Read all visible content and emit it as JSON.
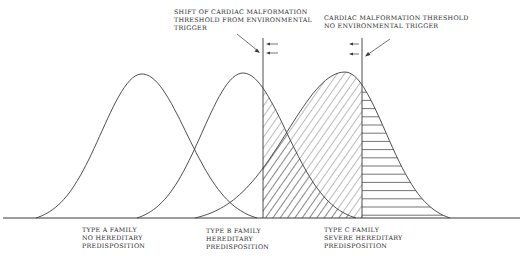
{
  "diagram": {
    "annotations": {
      "shift_threshold": [
        "SHIFT OF CARDIAC MALFORMATION",
        "THRESHOLD FROM ENVIRONMENTAL",
        "TRIGGER"
      ],
      "base_threshold": [
        "CARDIAC MALFORMATION THRESHOLD",
        "NO ENVIRONMENTAL TRIGGER"
      ]
    },
    "families": [
      {
        "id": "A",
        "label": [
          "TYPE A FAMILY",
          "NO HEREDITARY",
          "PREDISPOSITION"
        ]
      },
      {
        "id": "B",
        "label": [
          "TYPE B FAMILY",
          "HEREDITARY",
          "PREDISPOSITION"
        ]
      },
      {
        "id": "C",
        "label": [
          "TYPE C FAMILY",
          "SEVERE HEREDITARY",
          "PREDISPOSITION"
        ]
      }
    ],
    "regions": {
      "diagonal_hatch": "affected with environmental trigger",
      "horizontal_hatch": "affected without environmental trigger"
    },
    "colors": {
      "ink": "#3a3a3a",
      "background": "#ffffff"
    }
  }
}
